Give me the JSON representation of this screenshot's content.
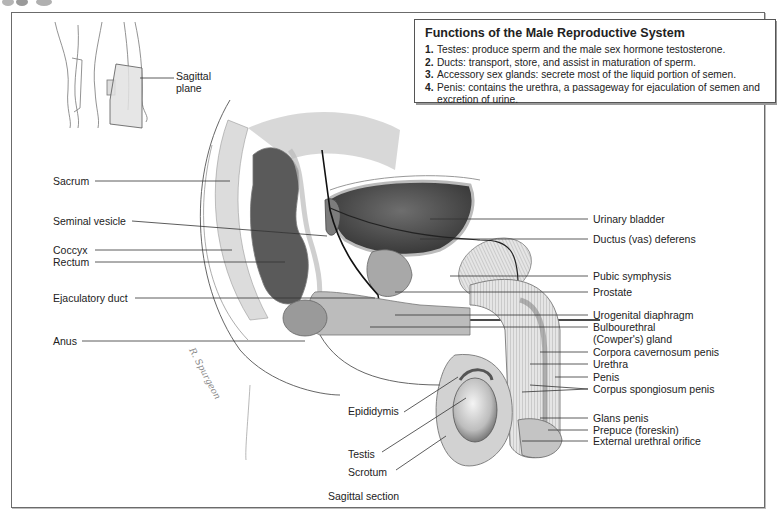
{
  "info_box": {
    "title": "Functions of the Male Reproductive System",
    "items": [
      {
        "num": "1.",
        "text": "Testes: produce sperm and the male sex hormone testosterone."
      },
      {
        "num": "2.",
        "text": "Ducts: transport, store, and assist in maturation of sperm."
      },
      {
        "num": "3.",
        "text": "Accessory sex glands: secrete most of the liquid portion of semen."
      },
      {
        "num": "4.",
        "text": "Penis: contains the urethra, a passageway for ejaculation of semen and excretion of urine."
      }
    ]
  },
  "inset": {
    "plane_label_line1": "Sagittal",
    "plane_label_line2": "plane"
  },
  "labels_left": {
    "sacrum": "Sacrum",
    "seminal_vesicle": "Seminal vesicle",
    "coccyx": "Coccyx",
    "rectum": "Rectum",
    "ejaculatory_duct": "Ejaculatory duct",
    "anus": "Anus"
  },
  "labels_right": {
    "urinary_bladder": "Urinary bladder",
    "ductus_deferens": "Ductus (vas) deferens",
    "pubic_symphysis": "Pubic symphysis",
    "prostate": "Prostate",
    "urogenital_diaphragm": "Urogenital diaphragm",
    "bulbourethral_line1": "Bulbourethral",
    "bulbourethral_line2": "(Cowper's) gland",
    "corpora_cavernosum": "Corpora cavernosum penis",
    "urethra": "Urethra",
    "penis": "Penis",
    "corpus_spongiosum": "Corpus spongiosum penis",
    "glans_penis": "Glans penis",
    "prepuce": "Prepuce (foreskin)",
    "external_urethral_orifice": "External urethral orifice"
  },
  "labels_bottom": {
    "epididymis": "Epididymis",
    "testis": "Testis",
    "scrotum": "Scrotum"
  },
  "caption": "Sagittal section",
  "signature": "R. Spurgeon",
  "colors": {
    "frame": "#6b6b6b",
    "leader_line": "#333333",
    "tissue_dark": "#4a4a4a",
    "tissue_mid": "#9a9a9a",
    "tissue_light": "#d6d6d6"
  }
}
